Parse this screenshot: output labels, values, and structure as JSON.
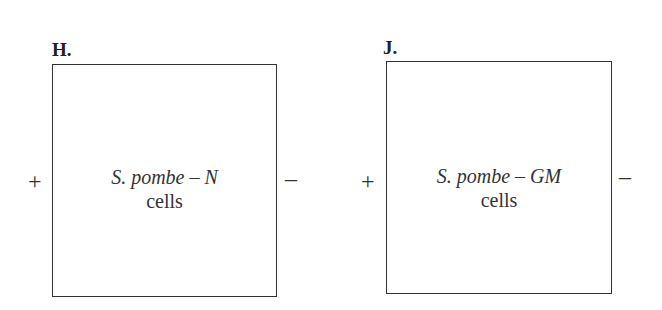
{
  "panels": [
    {
      "id": "H",
      "label": "H.",
      "species_label": "S. pombe – N",
      "cells_label": "cells",
      "left_electrode": "+",
      "right_electrode": "–"
    },
    {
      "id": "J",
      "label": "J.",
      "species_label": "S. pombe – GM",
      "cells_label": "cells",
      "left_electrode": "+",
      "right_electrode": "–"
    }
  ]
}
